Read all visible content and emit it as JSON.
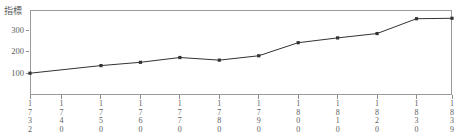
{
  "chart_data": {
    "type": "line",
    "title": "",
    "ylabel": "指標",
    "xlabel": "",
    "ylim": [
      0,
      390
    ],
    "xlim": [
      1732,
      1839
    ],
    "yticks": [
      100,
      200,
      300
    ],
    "ytick_labels": [
      "100",
      "200",
      "300"
    ],
    "xticks": [
      1732,
      1740,
      1750,
      1760,
      1770,
      1780,
      1790,
      1800,
      1810,
      1820,
      1830,
      1839
    ],
    "xtick_labels": [
      "1732",
      "1740",
      "1750",
      "1760",
      "1770",
      "1780",
      "1790",
      "1800",
      "1810",
      "1820",
      "1830",
      "1839"
    ],
    "grid": false,
    "legend": null,
    "marker": "square",
    "series": [
      {
        "name": "指標",
        "color": "#333333",
        "x": [
          1732,
          1750,
          1760,
          1770,
          1780,
          1790,
          1800,
          1810,
          1820,
          1830,
          1839
        ],
        "values": [
          100,
          135,
          150,
          172,
          160,
          180,
          240,
          262,
          282,
          350,
          352
        ]
      }
    ]
  },
  "axes": {
    "y_title": "指標",
    "y_tick_labels": [
      "300",
      "200",
      "100"
    ],
    "x_tick_labels": [
      "1732",
      "1740",
      "1750",
      "1760",
      "1770",
      "1780",
      "1790",
      "1800",
      "1810",
      "1820",
      "1830",
      "1839"
    ]
  }
}
